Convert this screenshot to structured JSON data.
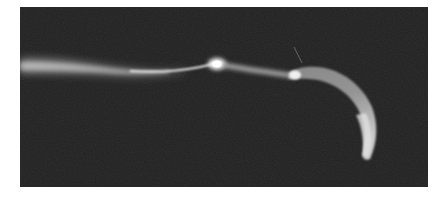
{
  "image": {
    "kind": "grayscale micrograph",
    "subject": "elongated cell with long tail and curved crescent head",
    "colors": {
      "page_background": "#ffffff",
      "photo_background": "#1f1f1f",
      "specimen_highlight": "#f2f2f2",
      "specimen_mid": "#9a9a9a"
    },
    "frame": {
      "x": 20,
      "y": 7,
      "width": 408,
      "height": 180
    }
  }
}
